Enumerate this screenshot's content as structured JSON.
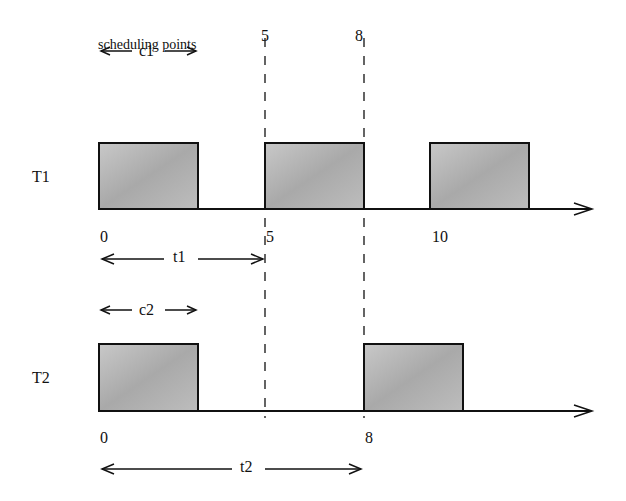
{
  "title": "scheduling points",
  "scheduling_points": [
    "5",
    "8"
  ],
  "tasks": [
    {
      "name": "T1",
      "compute_label": "c1",
      "period_label": "t1",
      "ticks": [
        "0",
        "5",
        "10"
      ],
      "bursts": [
        [
          0,
          3
        ],
        [
          5,
          8
        ],
        [
          10,
          13
        ]
      ]
    },
    {
      "name": "T2",
      "compute_label": "c2",
      "period_label": "t2",
      "ticks": [
        "0",
        "8"
      ],
      "bursts": [
        [
          0,
          3
        ],
        [
          8,
          11
        ]
      ]
    }
  ],
  "colors": {
    "box_fill": "#b5b5b5",
    "line": "#111111"
  }
}
